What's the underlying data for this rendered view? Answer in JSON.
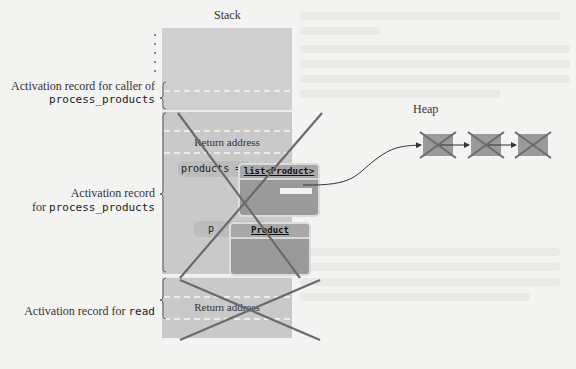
{
  "titles": {
    "stack": "Stack",
    "heap": "Heap"
  },
  "labels": {
    "caller_prefix": "Activation record for caller of",
    "caller_fn": "process_products",
    "process_prefix": "Activation record",
    "process_line2_prefix": "for ",
    "process_fn": "process_products",
    "read_prefix": "Activation record for ",
    "read_fn": "read"
  },
  "stack": {
    "return_address_1": "Return address",
    "return_address_2": "Return address",
    "var_products": "products =",
    "var_p": "p",
    "list_type": "list<Product>",
    "product_type": "Product"
  },
  "heap": {
    "node_count": 3
  },
  "colors": {
    "background": "#f3f3f1",
    "stack_fill": "#c9c9c9",
    "object_fill": "#9a9a9a",
    "cross_stroke": "#6b6b6b",
    "arrow": "#333333"
  }
}
